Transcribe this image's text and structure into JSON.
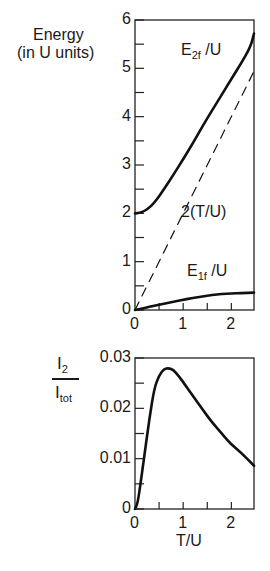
{
  "chart_data": [
    {
      "type": "line",
      "title": "",
      "ylabel": "Energy (in U units)",
      "ylabel_lines": [
        "Energy",
        "(in U units)"
      ],
      "xlabel": "",
      "xlim": [
        0,
        2.47
      ],
      "ylim": [
        0,
        6
      ],
      "xticks": [
        0,
        1,
        2
      ],
      "xminor": [
        0.5,
        1.5
      ],
      "yticks": [
        0,
        1,
        2,
        3,
        4,
        5,
        6
      ],
      "yminor": [
        0.5,
        1.5,
        2.5,
        3.5,
        4.5,
        5.5
      ],
      "grid": false,
      "legend": "inline annotations",
      "series": [
        {
          "name": "E_2f /U",
          "style": "solid",
          "x": [
            0,
            0.1,
            0.2,
            0.3,
            0.4,
            0.5,
            0.6,
            0.8,
            1.0,
            1.2,
            1.4,
            1.6,
            1.8,
            2.0,
            2.2,
            2.4,
            2.47
          ],
          "y": [
            2.0,
            2.01,
            2.05,
            2.12,
            2.22,
            2.35,
            2.5,
            2.8,
            3.12,
            3.45,
            3.8,
            4.13,
            4.45,
            4.78,
            5.1,
            5.45,
            5.72
          ]
        },
        {
          "name": "2(T/U)",
          "style": "dashed",
          "x": [
            0,
            2.5
          ],
          "y": [
            0,
            5.0
          ]
        },
        {
          "name": "E_1f /U",
          "style": "solid",
          "x": [
            0,
            0.2,
            0.4,
            0.6,
            0.8,
            1.0,
            1.2,
            1.4,
            1.6,
            1.8,
            2.0,
            2.2,
            2.47
          ],
          "y": [
            0,
            0.04,
            0.09,
            0.13,
            0.17,
            0.21,
            0.25,
            0.28,
            0.31,
            0.33,
            0.34,
            0.35,
            0.36
          ]
        }
      ],
      "annotations": [
        "E2f /U",
        "2(T/U)",
        "E1f /U"
      ]
    },
    {
      "type": "line",
      "title": "",
      "ylabel": "I_2 / I_tot",
      "xlabel": "T/U",
      "xlim": [
        0,
        2.47
      ],
      "ylim": [
        0,
        0.03
      ],
      "xticks": [
        0,
        1,
        2
      ],
      "xminor": [
        0.5,
        1.5
      ],
      "yticks": [
        0,
        0.01,
        0.02,
        0.03
      ],
      "yminor": [
        0.005,
        0.015,
        0.025
      ],
      "grid": false,
      "series": [
        {
          "name": "I2/Itot",
          "style": "solid",
          "x": [
            0,
            0.05,
            0.1,
            0.2,
            0.3,
            0.4,
            0.5,
            0.6,
            0.7,
            0.8,
            0.9,
            1.0,
            1.2,
            1.4,
            1.6,
            1.8,
            2.0,
            2.2,
            2.47
          ],
          "y": [
            0,
            0.001,
            0.004,
            0.011,
            0.018,
            0.024,
            0.0265,
            0.0278,
            0.028,
            0.0276,
            0.0265,
            0.0252,
            0.0225,
            0.0198,
            0.0172,
            0.015,
            0.0128,
            0.0112,
            0.0086
          ]
        }
      ]
    }
  ],
  "labels": {
    "top_ylabel_line1": "Energy",
    "top_ylabel_line2": "(in U units)",
    "e2f_main": "E",
    "e2f_sub": "2f",
    "e2f_tail": " /U",
    "dash_label": "2(T/U)",
    "e1f_main": "E",
    "e1f_sub": "1f",
    "e1f_tail": " /U",
    "bot_ylabel_num_main": "I",
    "bot_ylabel_num_sub": "2",
    "bot_ylabel_den_main": "I",
    "bot_ylabel_den_sub": "tot",
    "bot_xlabel": "T/U",
    "top_yticks": [
      "0",
      "1",
      "2",
      "3",
      "4",
      "5",
      "6"
    ],
    "top_xticks": [
      "0",
      "1",
      "2"
    ],
    "bot_yticks": [
      "0",
      "0.01",
      "0.02",
      "0.03"
    ],
    "bot_xticks": [
      "0",
      "1",
      "2"
    ]
  }
}
